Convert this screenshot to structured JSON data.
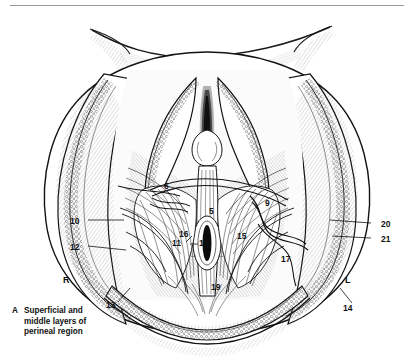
{
  "figure": {
    "caption_letter": "A",
    "caption_text": "Superficial and middle layers of perineal region",
    "caption_lines": [
      "Superficial and",
      "middle layers of",
      "perineal region"
    ],
    "orientation_left": "R",
    "orientation_right": "L",
    "style": {
      "background": "#ffffff",
      "ink": "#111111",
      "rule": "#9a9a9a"
    }
  },
  "labels": [
    {
      "id": "6",
      "text": "6",
      "x": 168,
      "y": 186
    },
    {
      "id": "5",
      "text": "5",
      "x": 213,
      "y": 211
    },
    {
      "id": "9",
      "text": "9",
      "x": 269,
      "y": 203
    },
    {
      "id": "10",
      "text": "10",
      "x": 74,
      "y": 222
    },
    {
      "id": "12",
      "text": "12",
      "x": 74,
      "y": 248
    },
    {
      "id": "16",
      "text": "16",
      "x": 183,
      "y": 234
    },
    {
      "id": "11",
      "text": "11",
      "x": 176,
      "y": 243
    },
    {
      "id": "18",
      "text": "18",
      "x": 204,
      "y": 243
    },
    {
      "id": "15",
      "text": "15",
      "x": 241,
      "y": 236
    },
    {
      "id": "17",
      "text": "17",
      "x": 285,
      "y": 259
    },
    {
      "id": "20",
      "text": "20",
      "x": 385,
      "y": 225
    },
    {
      "id": "21",
      "text": "21",
      "x": 385,
      "y": 240
    },
    {
      "id": "13",
      "text": "13",
      "x": 110,
      "y": 305
    },
    {
      "id": "14",
      "text": "14",
      "x": 347,
      "y": 308
    },
    {
      "id": "19",
      "text": "19",
      "x": 215,
      "y": 287
    }
  ]
}
